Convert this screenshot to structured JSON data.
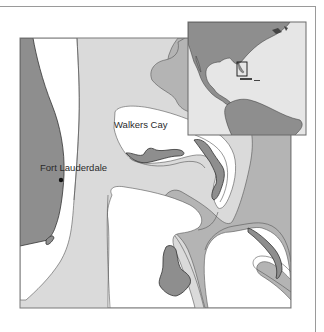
{
  "map": {
    "labels": {
      "walkers_cay": "Walkers Cay",
      "fort_lauderdale": "Fort Lauderdale"
    },
    "colors": {
      "land": "#8e8e8e",
      "deep_water": "#b4b4b4",
      "mid_water": "#dadada",
      "shallow_water": "#ffffff",
      "contour": "#555555",
      "frame": "#7a7a7a"
    },
    "inset": {
      "region": "Americas overview",
      "highlight_box": "Bahamas / South Florida locator"
    }
  }
}
